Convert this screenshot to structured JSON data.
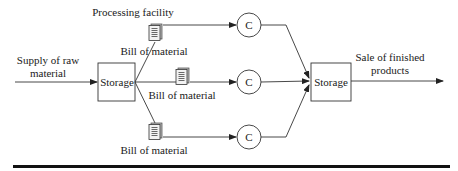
{
  "diagram": {
    "input_label_line1": "Supply of raw",
    "input_label_line2": "material",
    "output_label_line1": "Sale of finished",
    "output_label_line2": "products",
    "processing_facility_label": "Processing facility",
    "storage_left_label": "Storage",
    "storage_right_label": "Storage",
    "branches": [
      {
        "doc_label": "Bill of material",
        "node_label": "C",
        "doc_icon": "document-icon"
      },
      {
        "doc_label": "Bill of material",
        "node_label": "C",
        "doc_icon": "document-icon"
      },
      {
        "doc_label": "Bill of material",
        "node_label": "C",
        "doc_icon": "document-icon"
      }
    ],
    "colors": {
      "stroke": "#333333",
      "text": "#1a1a1a",
      "rule": "#111111"
    }
  }
}
